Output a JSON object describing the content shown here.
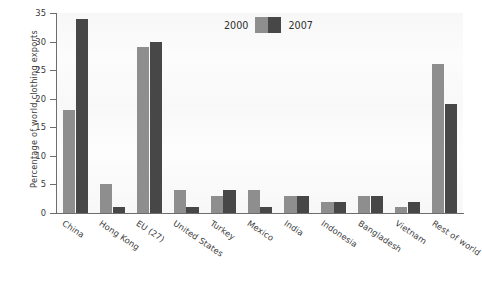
{
  "chart_data": {
    "type": "bar",
    "title": "",
    "xlabel": "",
    "ylabel": "Percentage of world clothing exports",
    "ylim": [
      0,
      35
    ],
    "yticks": [
      0,
      5,
      10,
      15,
      20,
      25,
      30,
      35
    ],
    "ytick_labels": [
      "0",
      "5",
      "10",
      "15",
      "20",
      "25",
      "30",
      "35"
    ],
    "grid": false,
    "legend_position": "top-center",
    "categories": [
      "China",
      "Hong Kong",
      "EU (27)",
      "United States",
      "Turkey",
      "Mexico",
      "India",
      "Indonesia",
      "Bangladesh",
      "Vietnam",
      "Rest of world"
    ],
    "series": [
      {
        "name": "2000",
        "color": "#8e8e8e",
        "values": [
          18,
          5,
          29,
          4,
          3,
          4,
          3,
          2,
          3,
          1,
          26
        ]
      },
      {
        "name": "2007",
        "color": "#474747",
        "values": [
          34,
          1,
          30,
          1,
          4,
          1,
          3,
          2,
          3,
          2,
          19
        ]
      }
    ]
  },
  "legend": {
    "label_2000": "2000",
    "label_2007": "2007"
  }
}
